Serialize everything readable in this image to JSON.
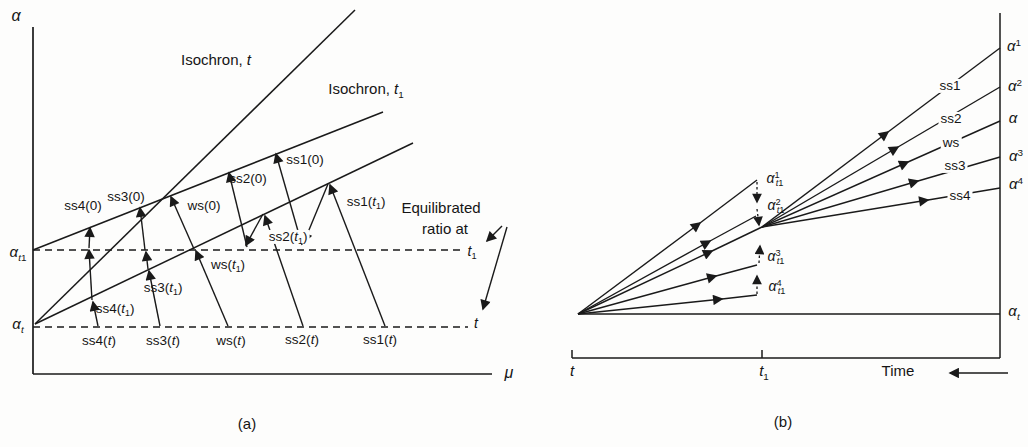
{
  "figure": {
    "stroke_color": "#1a1a1a",
    "background_color": "#fdfdfc",
    "panel_a": {
      "caption": "(a)",
      "labels": [
        {
          "id": "alpha-axis-label-a",
          "text": "_α_",
          "x": 16,
          "y": 16,
          "size": 16
        },
        {
          "id": "mu-axis-label-a",
          "text": "_μ_",
          "x": 509,
          "y": 373,
          "size": 16
        },
        {
          "id": "isochron-t-label",
          "text": "Isochron, _t_",
          "x": 216,
          "y": 60,
          "size": 15
        },
        {
          "id": "isochron-t1-label",
          "text": "Isochron, _t_~1~",
          "x": 366,
          "y": 89,
          "size": 15
        },
        {
          "id": "alpha-t1-axis-label",
          "text": "_α_~_t_1~",
          "x": 18,
          "y": 252,
          "size": 15
        },
        {
          "id": "alpha-t-axis-label",
          "text": "_α_~_t_~",
          "x": 18,
          "y": 324,
          "size": 15
        },
        {
          "id": "ss4-0-label",
          "text": "ss4(0)",
          "x": 83,
          "y": 206
        },
        {
          "id": "ss3-0-label",
          "text": "ss3(0)",
          "x": 126,
          "y": 197
        },
        {
          "id": "ws-0-label",
          "text": "ws(0)",
          "x": 204,
          "y": 206
        },
        {
          "id": "ss2-0-label",
          "text": "ss2(0)",
          "x": 248,
          "y": 179
        },
        {
          "id": "ss1-0-label",
          "text": "ss1(0)",
          "x": 305,
          "y": 160
        },
        {
          "id": "ss1-t1-label",
          "text": "ss1(_t_~1~)",
          "x": 366,
          "y": 202
        },
        {
          "id": "ss2-t1-label",
          "text": "ss2(_t_~1~)",
          "x": 288,
          "y": 237,
          "bg": true
        },
        {
          "id": "ws-t1-label",
          "text": "ws(_t_~1~)",
          "x": 228,
          "y": 265
        },
        {
          "id": "ss3-t1-label",
          "text": "ss3(_t_~1~)",
          "x": 163,
          "y": 288
        },
        {
          "id": "ss4-t1-label",
          "text": "ss4(_t_~1~)",
          "x": 115,
          "y": 309
        },
        {
          "id": "ss4-t-label",
          "text": "ss4(_t_)",
          "x": 99,
          "y": 341
        },
        {
          "id": "ss3-t-label",
          "text": "ss3(_t_)",
          "x": 163,
          "y": 341
        },
        {
          "id": "ws-t-label",
          "text": "ws(_t_)",
          "x": 231,
          "y": 341
        },
        {
          "id": "ss2-t-label",
          "text": "ss2(_t_)",
          "x": 302,
          "y": 340
        },
        {
          "id": "ss1-t-label",
          "text": "ss1(_t_)",
          "x": 380,
          "y": 340
        },
        {
          "id": "equilibrated-label",
          "text": "Equilibrated",
          "x": 441,
          "y": 208,
          "size": 15
        },
        {
          "id": "ratio-at-label",
          "text": "ratio at",
          "x": 445,
          "y": 229,
          "size": 15
        },
        {
          "id": "t1-right-label",
          "text": "_t_~1~",
          "x": 472,
          "y": 251,
          "size": 14
        },
        {
          "id": "t-right-label",
          "text": "_t_",
          "x": 476,
          "y": 323,
          "size": 14
        },
        {
          "id": "caption-a",
          "text": "(a)",
          "x": 247,
          "y": 424,
          "size": 15
        }
      ]
    },
    "panel_b": {
      "caption": "(b)",
      "labels": [
        {
          "id": "alpha1-label",
          "text": "_α_^1^",
          "x": 1014,
          "y": 46,
          "size": 15
        },
        {
          "id": "alpha2-label",
          "text": "_α_^2^",
          "x": 1015,
          "y": 86,
          "size": 15
        },
        {
          "id": "alpha-plain-label",
          "text": "_α_",
          "x": 1013,
          "y": 118,
          "size": 15
        },
        {
          "id": "alpha3-label",
          "text": "_α_^3^",
          "x": 1016,
          "y": 156,
          "size": 15
        },
        {
          "id": "alpha4-label",
          "text": "_α_^4^",
          "x": 1016,
          "y": 184,
          "size": 15
        },
        {
          "id": "ss1-line-label",
          "text": "ss1",
          "x": 950,
          "y": 86,
          "bg": true
        },
        {
          "id": "ss2-line-label",
          "text": "ss2",
          "x": 951,
          "y": 119,
          "bg": true
        },
        {
          "id": "ws-line-label",
          "text": "ws",
          "x": 951,
          "y": 143,
          "bg": true
        },
        {
          "id": "ss3-line-label",
          "text": "ss3",
          "x": 955,
          "y": 166,
          "bg": true
        },
        {
          "id": "ss4-line-label",
          "text": "ss4",
          "x": 960,
          "y": 196,
          "bg": true
        },
        {
          "id": "alpha1-t1-label",
          "text": "_α_^1^~_t_1~",
          "x": 775,
          "y": 178,
          "size": 14
        },
        {
          "id": "alpha2-t1-label",
          "text": "_α_^2^~_t_1~",
          "x": 776,
          "y": 205,
          "size": 14
        },
        {
          "id": "alpha3-t1-label",
          "text": "_α_^3^~_t_1~",
          "x": 776,
          "y": 256,
          "size": 14
        },
        {
          "id": "alpha4-t1-label",
          "text": "_α_^4^~_t_1~",
          "x": 777,
          "y": 286,
          "size": 14
        },
        {
          "id": "alpha-t-right-label",
          "text": "_α_~_t_~",
          "x": 1014,
          "y": 311,
          "size": 15
        },
        {
          "id": "t-tick-label",
          "text": "_t_",
          "x": 572,
          "y": 371,
          "size": 15
        },
        {
          "id": "t1-tick-label",
          "text": "_t_~1~",
          "x": 764,
          "y": 371,
          "size": 15
        },
        {
          "id": "time-axis-label",
          "text": "Time",
          "x": 898,
          "y": 371,
          "size": 15
        },
        {
          "id": "caption-b",
          "text": "(b)",
          "x": 783,
          "y": 422,
          "size": 15
        }
      ]
    }
  }
}
